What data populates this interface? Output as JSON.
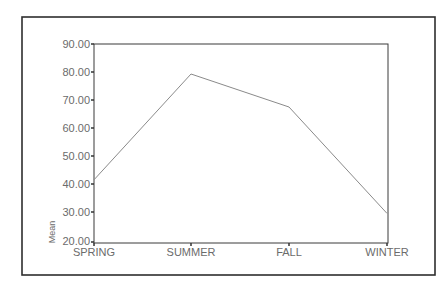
{
  "chart_data": {
    "type": "line",
    "title": "",
    "xlabel": "",
    "ylabel": "Mean",
    "categories": [
      "SPRING",
      "SUMMER",
      "FALL",
      "WINTER"
    ],
    "values": [
      41.5,
      79.3,
      67.5,
      29.5
    ],
    "ylim": [
      20,
      90
    ],
    "yticks": [
      "20.00",
      "30.00",
      "40.00",
      "50.00",
      "60.00",
      "70.00",
      "80.00",
      "90.00"
    ],
    "grid": false,
    "legend": null,
    "line_color": "#8a8a8a",
    "axis_color": "#3a3a3a",
    "frame_color": "#2e2e2e"
  },
  "axes": {
    "y_title": "Mean",
    "y_ticks": [
      {
        "label": "90.00",
        "value": 90
      },
      {
        "label": "80.00",
        "value": 80
      },
      {
        "label": "70.00",
        "value": 70
      },
      {
        "label": "60.00",
        "value": 60
      },
      {
        "label": "50.00",
        "value": 50
      },
      {
        "label": "40.00",
        "value": 40
      },
      {
        "label": "30.00",
        "value": 30
      },
      {
        "label": "20.00",
        "value": 20
      }
    ],
    "x_ticks": [
      {
        "label": "SPRING"
      },
      {
        "label": "SUMMER"
      },
      {
        "label": "FALL"
      },
      {
        "label": "WINTER"
      }
    ]
  }
}
